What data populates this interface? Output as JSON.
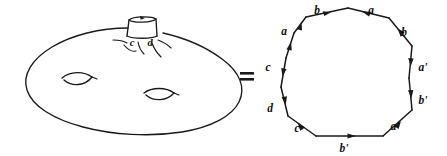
{
  "figure": {
    "relation_symbol": "=",
    "ink_color": "#1a1a1a",
    "background_color": "#ffffff"
  },
  "surface": {
    "name": "genus-three-surface",
    "description": "Flattened blob-shaped surface with two lens-shaped holes and one protruding tube handle",
    "handle_labels": [
      {
        "id": "handle-label-c",
        "text": "c",
        "x": 132,
        "y": 42
      },
      {
        "id": "handle-label-d",
        "text": "d",
        "x": 149,
        "y": 42
      }
    ],
    "hole_count": 2,
    "handle_count": 1
  },
  "polygon": {
    "name": "twelve-gon",
    "sides": 12,
    "center": {
      "x": 349,
      "y": 77
    },
    "edges": [
      {
        "id": "edge-1",
        "label": "b",
        "label_x": 317,
        "label_y": 14,
        "direction": "right"
      },
      {
        "id": "edge-2",
        "label": "a",
        "label_x": 371,
        "label_y": 14,
        "direction": "left"
      },
      {
        "id": "edge-3",
        "label": "b",
        "label_x": 402,
        "label_y": 36,
        "direction": "up-left"
      },
      {
        "id": "edge-4",
        "label": "a'",
        "label_x": 416,
        "label_y": 70,
        "direction": "down"
      },
      {
        "id": "edge-5",
        "label": "b'",
        "label_x": 416,
        "label_y": 103,
        "direction": "down"
      },
      {
        "id": "edge-6",
        "label": "a'",
        "label_x": 392,
        "label_y": 129,
        "direction": "up-right"
      },
      {
        "id": "edge-7",
        "label": "b'",
        "label_x": 344,
        "label_y": 150,
        "direction": "right"
      },
      {
        "id": "edge-8",
        "label": "c",
        "label_x": 299,
        "label_y": 131,
        "direction": "up-left"
      },
      {
        "id": "edge-9",
        "label": "d",
        "label_x": 270,
        "label_y": 110,
        "direction": "down"
      },
      {
        "id": "edge-10",
        "label": "c",
        "label_x": 265,
        "label_y": 69,
        "direction": "down"
      },
      {
        "id": "edge-11",
        "label": "a",
        "label_x": 281,
        "label_y": 35,
        "direction": "up-right"
      },
      {
        "id": "edge-12",
        "label": "b",
        "label_x": 317,
        "label_y": 14,
        "direction": "up-right"
      }
    ],
    "edge_word": "b a b a' b' a' b' c d c a"
  },
  "labels": {
    "c": "c",
    "d": "d",
    "a": "a",
    "b": "b",
    "a_prime": "a'",
    "b_prime": "b'"
  }
}
